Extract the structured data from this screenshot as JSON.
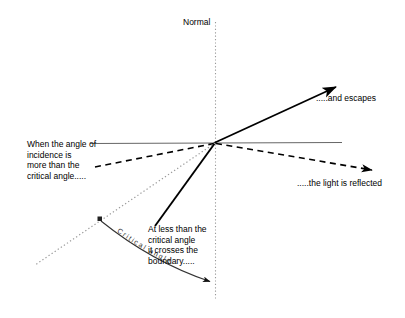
{
  "diagram": {
    "normal_label": "Normal",
    "labels": {
      "incidence": "When the angle of\nincidence is\nmore than the\ncritical angle.....",
      "escapes": ".....and escapes",
      "reflected": ".....the light is reflected",
      "crosses": "At less than the\ncritical angle\nit crosses the\nboundary.....",
      "critical_angle_arc": "Critical angle"
    },
    "colors": {
      "ink": "#000000",
      "boundary": "#555555",
      "normal_dotted": "#888888",
      "arc": "#444444",
      "background": "#ffffff"
    },
    "geometry": {
      "intersection_point": [
        215,
        143
      ],
      "boundary_line": {
        "x1": 90,
        "y1": 143,
        "x2": 342,
        "y2": 142
      },
      "normal_line": {
        "x1": 215,
        "y1": 22,
        "x2": 215,
        "y2": 300
      },
      "escaping_ray": {
        "x1": 216,
        "y1": 142,
        "x2": 338,
        "y2": 86,
        "style": "solid",
        "arrow": true
      },
      "incident_dashed_ray": {
        "x1": 95,
        "y1": 167,
        "x2": 215,
        "y2": 143,
        "style": "dashed",
        "arrow": false
      },
      "reflected_dashed_ray": {
        "x1": 215,
        "y1": 143,
        "x2": 375,
        "y2": 170,
        "style": "dashed",
        "arrow": true
      },
      "crossing_solid_ray": {
        "x1": 215,
        "y1": 143,
        "x2": 155,
        "y2": 225,
        "style": "solid",
        "arrow": false
      },
      "dotted_incident_ray": {
        "x1": 215,
        "y1": 143,
        "x2": 35,
        "y2": 265,
        "style": "dotted",
        "arrow": false
      },
      "critical_angle_arc": {
        "start": [
          100,
          219
        ],
        "end": [
          215,
          282
        ],
        "arrow": true
      },
      "arc_start_dot": [
        100,
        219
      ]
    }
  }
}
